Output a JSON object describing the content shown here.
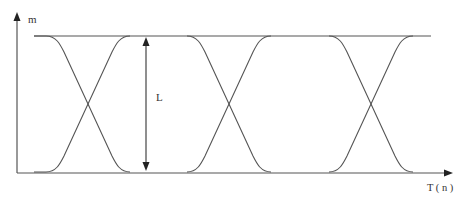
{
  "axes": {
    "y_label": "m",
    "x_label": "T ( n )"
  },
  "annotation": {
    "eye_opening_label": "L"
  },
  "colors": {
    "line": "#555555",
    "text": "#333333",
    "background": "#ffffff"
  },
  "geometry": {
    "top_level_y": 36,
    "bottom_level_y": 172,
    "crossings_x": [
      88,
      229,
      371
    ]
  }
}
